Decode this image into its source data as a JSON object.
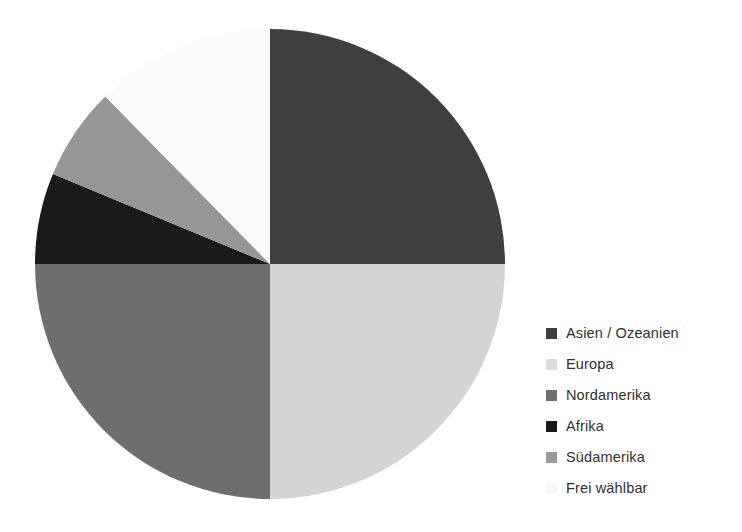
{
  "chart_data": {
    "type": "pie",
    "title": "",
    "subtitle": "",
    "xlabel": "",
    "ylabel": "",
    "grid": false,
    "legend_position": "right",
    "start_angle_deg": 0,
    "direction": "clockwise",
    "categories": [
      "Asien / Ozeanien",
      "Europa",
      "Nordamerika",
      "Afrika",
      "Südamerika",
      "Frei wählbar"
    ],
    "values": [
      25,
      25,
      25,
      6.25,
      6.25,
      12.5
    ],
    "units": "percent",
    "slices": [
      {
        "label": "Asien / Ozeanien",
        "value": 25,
        "start_deg": 0,
        "end_deg": 90,
        "color": "#3f3f3f",
        "swatch_color": "#3f3f3f"
      },
      {
        "label": "Europa",
        "value": 25,
        "start_deg": 90,
        "end_deg": 180,
        "color": "#d4d4d4",
        "swatch_color": "#dcdcdc"
      },
      {
        "label": "Nordamerika",
        "value": 25,
        "start_deg": 180,
        "end_deg": 270,
        "color": "#6e6e6e",
        "swatch_color": "#6e6e6e"
      },
      {
        "label": "Afrika",
        "value": 6.25,
        "start_deg": 270,
        "end_deg": 292.5,
        "color": "#1a1a1a",
        "swatch_color": "#1a1a1a"
      },
      {
        "label": "Südamerika",
        "value": 6.25,
        "start_deg": 292.5,
        "end_deg": 315.5,
        "color": "#969696",
        "swatch_color": "#9a9a9a"
      },
      {
        "label": "Frei wählbar",
        "value": 12.5,
        "start_deg": 315.5,
        "end_deg": 360,
        "color": "#fbfbfb",
        "swatch_color": "#f7f7f7"
      }
    ]
  },
  "legend": {
    "items": [
      {
        "label": "Asien / Ozeanien"
      },
      {
        "label": "Europa"
      },
      {
        "label": "Nordamerika"
      },
      {
        "label": "Afrika"
      },
      {
        "label": "Südamerika"
      },
      {
        "label": "Frei wählbar"
      }
    ]
  },
  "colors": {
    "background": "#ffffff",
    "text": "#2f2f2f"
  }
}
